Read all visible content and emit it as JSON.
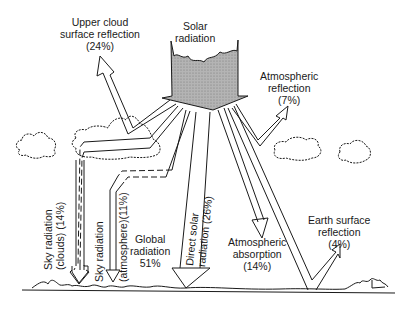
{
  "colors": {
    "line": "#1a1a1a",
    "solar_fill": "#a8a8a8",
    "background": "#ffffff"
  },
  "labels": {
    "solar": [
      "Solar",
      "radiation"
    ],
    "upper_cloud": [
      "Upper cloud",
      "surface reflection",
      "(24%)"
    ],
    "atmo_reflection": [
      "Atmospheric",
      "reflection",
      "(7%)"
    ],
    "sky_clouds": "Sky radiation (clouds) (14%)",
    "sky_clouds_l1": "Sky radiation",
    "sky_clouds_l2": "(clouds) (14%)",
    "sky_atmo_l1": "Sky radiation",
    "sky_atmo_l2": "(atmosphere)(11%)",
    "global": [
      "Global",
      "radiation",
      "51%"
    ],
    "direct_l1": "Direct solar",
    "direct_l2": "radiation (26%)",
    "absorption": [
      "Atmospheric",
      "absorption",
      "(14%)"
    ],
    "earth": [
      "Earth surface",
      "reflection",
      "(4%)"
    ]
  },
  "flows": [
    {
      "name": "Upper cloud surface reflection",
      "percent": 24
    },
    {
      "name": "Atmospheric reflection",
      "percent": 7
    },
    {
      "name": "Sky radiation (clouds)",
      "percent": 14
    },
    {
      "name": "Sky radiation (atmosphere)",
      "percent": 11
    },
    {
      "name": "Direct solar radiation",
      "percent": 26
    },
    {
      "name": "Global radiation",
      "percent": 51
    },
    {
      "name": "Atmospheric absorption",
      "percent": 14
    },
    {
      "name": "Earth surface reflection",
      "percent": 4
    }
  ]
}
